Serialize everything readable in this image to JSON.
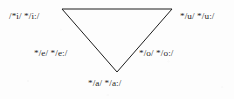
{
  "figure": {
    "kind": "vowel-triangle-diagram",
    "stroke_color": "#1d1d1d",
    "background_color": "#fdfdfd"
  },
  "triangle": {
    "vertices": {
      "top_left": {
        "x": 62,
        "y": 9
      },
      "top_right": {
        "x": 172,
        "y": 9
      },
      "apex": {
        "x": 117,
        "y": 72
      }
    },
    "stroke_width": 1
  },
  "labels": {
    "high_front": "/*i/ */i:/",
    "high_back": "*/u/ */u:/",
    "mid_front": "*/e/ */e:/",
    "mid_back": "*/o/ */o:/",
    "low_central": "*/a/ */a:/"
  }
}
